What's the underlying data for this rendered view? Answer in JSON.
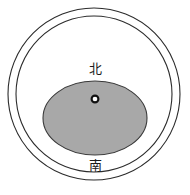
{
  "figure": {
    "name": "concentric-circle-orientation-diagram",
    "background_color": "#ffffff",
    "width": 190,
    "height": 195,
    "outer_ring": {
      "name": "outer-circle",
      "cx": 94,
      "cy": 94,
      "rx": 86,
      "ry": 86,
      "stroke_color": "#2b2b2b",
      "stroke_width": 1.1,
      "fill": "none"
    },
    "inner_ring": {
      "name": "inner-circle",
      "cx": 94,
      "cy": 94,
      "rx": 78,
      "ry": 78,
      "stroke_color": "#2b2b2b",
      "stroke_width": 1.1,
      "fill": "none"
    },
    "shaded_ellipse": {
      "name": "shaded-ellipse",
      "cx": 95,
      "cy": 118,
      "rx": 52,
      "ry": 37,
      "fill_color": "#a8a8a8",
      "stroke_color": "#3a3a3a",
      "stroke_width": 1.1
    },
    "center_marker": {
      "name": "center-point-marker",
      "cx": 95,
      "cy": 99,
      "r": 3.4,
      "fill_color": "#ffffff",
      "stroke_color": "#111111",
      "stroke_width": 2.1
    }
  },
  "labels": {
    "north": "北",
    "south": "南"
  }
}
